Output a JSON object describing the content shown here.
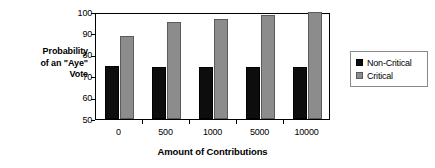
{
  "chart_data": {
    "type": "bar",
    "title": "",
    "xlabel": "Amount of Contributions",
    "ylabel": "Probability of an \"Aye\" Vote",
    "ylabel_lines": [
      "Probability",
      "of an \"Aye\"",
      "Vote"
    ],
    "categories": [
      "0",
      "500",
      "1000",
      "5000",
      "10000"
    ],
    "series": [
      {
        "name": "Non-Critical",
        "values": [
          75,
          74.5,
          74.4,
          74.2,
          74.1
        ],
        "color": "#0d0d0d"
      },
      {
        "name": "Critical",
        "values": [
          88.8,
          95.3,
          96.7,
          98.6,
          100
        ],
        "color": "#8c8c8c"
      }
    ],
    "ylim": [
      50,
      100
    ],
    "yticks": [
      "100",
      "90",
      "80",
      "70",
      "60",
      "50"
    ],
    "ytick_values": [
      100,
      90,
      80,
      70,
      60,
      50
    ],
    "grid": false,
    "legend_position": "right",
    "legend_entries": [
      "Non-Critical",
      "Critical"
    ]
  }
}
